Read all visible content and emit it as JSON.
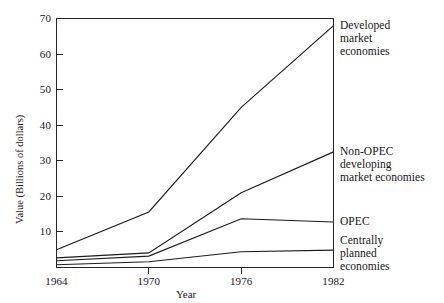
{
  "chart_data": {
    "type": "line",
    "title": "",
    "xlabel": "Year",
    "ylabel": "Value (Billions of dollars)",
    "x": [
      1964,
      1970,
      1976,
      1982
    ],
    "xlim": [
      1964,
      1982
    ],
    "ylim": [
      0,
      70
    ],
    "xticks": [
      "1964",
      "1970",
      "1976",
      "1982"
    ],
    "yticks": [
      "10",
      "20",
      "30",
      "40",
      "50",
      "60",
      "70"
    ],
    "ytick_values": [
      10,
      20,
      30,
      40,
      50,
      60,
      70
    ],
    "grid": false,
    "legend_position": "right-inline-labels",
    "series": [
      {
        "name": "Developed market economies",
        "label_lines": "Developed\nmarket\neconomies",
        "values": [
          5,
          15.6,
          45,
          68
        ]
      },
      {
        "name": "Non-OPEC developing market economies",
        "label_lines": "Non-OPEC\ndeveloping\nmarket economies",
        "values": [
          2.7,
          4.1,
          21,
          32.5
        ]
      },
      {
        "name": "OPEC",
        "label_lines": "OPEC",
        "values": [
          1.9,
          3.2,
          13.7,
          12.8
        ]
      },
      {
        "name": "Centrally planned economies",
        "label_lines": "Centrally\nplanned\neconomies",
        "values": [
          0.8,
          1.6,
          4.4,
          4.9
        ]
      }
    ]
  },
  "axes": {
    "x_title": "Year",
    "y_title": "Value (Billions of dollars)"
  }
}
